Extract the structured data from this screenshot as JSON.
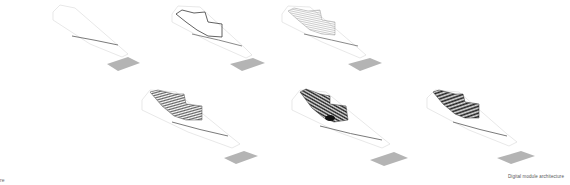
{
  "title": "Digital module architecture",
  "caption": "Digital module architecture",
  "corner_mark": "re",
  "colors": {
    "site_outline": "#d6d6d6",
    "ridge_line": "#6b6b6b",
    "base_plate": "#b4b4b4",
    "module_outline": "#3a3a3a",
    "hatch_light": "#9a9a9a",
    "hatch_dark": "#2a2a2a"
  },
  "panels": [
    {
      "id": "stage-1",
      "label": "Empty site",
      "hatch_density": 0
    },
    {
      "id": "stage-2",
      "label": "Module outline",
      "hatch_density": 0
    },
    {
      "id": "stage-3",
      "label": "Light hatching",
      "hatch_density": 1
    },
    {
      "id": "stage-4",
      "label": "Medium hatching",
      "hatch_density": 2
    },
    {
      "id": "stage-5",
      "label": "Dense hatching",
      "hatch_density": 3
    },
    {
      "id": "stage-6",
      "label": "Dense hatching final",
      "hatch_density": 3
    }
  ]
}
